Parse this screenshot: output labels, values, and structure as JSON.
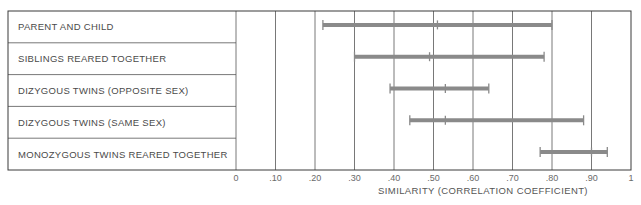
{
  "chart_data": {
    "type": "range",
    "title": "",
    "xlabel": "SIMILARITY (CORRELATION COEFFICIENT)",
    "ylabel": "",
    "xlim": [
      0,
      1
    ],
    "grid": true,
    "x_ticks": [
      {
        "value": 0,
        "label": "0"
      },
      {
        "value": 0.1,
        "label": ".10"
      },
      {
        "value": 0.2,
        "label": ".20"
      },
      {
        "value": 0.3,
        "label": ".30"
      },
      {
        "value": 0.4,
        "label": ".40"
      },
      {
        "value": 0.5,
        "label": ".50"
      },
      {
        "value": 0.6,
        "label": ".60"
      },
      {
        "value": 0.7,
        "label": ".70"
      },
      {
        "value": 0.8,
        "label": ".80"
      },
      {
        "value": 0.9,
        "label": ".90"
      },
      {
        "value": 1,
        "label": "1"
      }
    ],
    "categories": [
      "PARENT AND CHILD",
      "SIBLINGS REARED TOGETHER",
      "DIZYGOUS TWINS (OPPOSITE SEX)",
      "DIZYGOUS TWINS (SAME SEX)",
      "MONOZYGOUS TWINS REARED TOGETHER"
    ],
    "series": [
      {
        "name": "PARENT AND CHILD",
        "min": 0.22,
        "median": 0.51,
        "max": 0.8
      },
      {
        "name": "SIBLINGS REARED TOGETHER",
        "min": 0.3,
        "median": 0.49,
        "max": 0.78
      },
      {
        "name": "DIZYGOUS TWINS (OPPOSITE SEX)",
        "min": 0.39,
        "median": 0.53,
        "max": 0.64
      },
      {
        "name": "DIZYGOUS TWINS (SAME SEX)",
        "min": 0.44,
        "median": 0.53,
        "max": 0.88
      },
      {
        "name": "MONOZYGOUS TWINS REARED TOGETHER",
        "min": 0.77,
        "median": 0.9,
        "max": 0.94
      }
    ],
    "colors": {
      "bar": "#8a8a8a",
      "frame": "#3a3a3a",
      "text": "#4a4a4a"
    }
  }
}
